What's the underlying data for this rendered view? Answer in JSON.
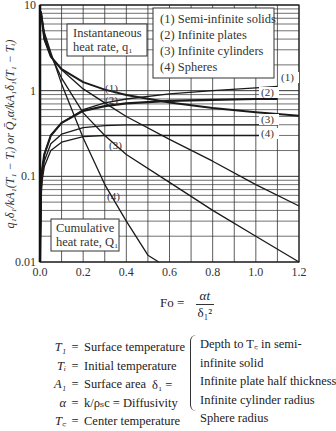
{
  "chart_data": {
    "type": "line",
    "title": "",
    "xlabel": "Fo = αt / δ₁²",
    "ylabel": "q₁δ₁/kA₁(T₁ − Tᵢ)  or  Q̄₁α/kA₁δ₁(T₁ − Tᵢ)",
    "xlim": [
      0.0,
      1.2
    ],
    "ylim": [
      0.01,
      10
    ],
    "yscale": "log",
    "grid": true,
    "x_ticks": [
      "0.0",
      "0.2",
      "0.4",
      "0.6",
      "0.8",
      "1.0",
      "1.2"
    ],
    "y_ticks": [
      "0.01",
      "0.1",
      "1",
      "10"
    ],
    "legend": {
      "placement": "top-right",
      "entries": [
        "(1) Semi-infinite solids",
        "(2) Infinite plates",
        "(3) Infinite cylinders",
        "(4) Spheres"
      ]
    },
    "annotations": {
      "instantaneous_box": [
        "Instantaneous",
        "heat rate, q₁"
      ],
      "cumulative_box": [
        "Cumulative",
        "heat rate, Q₁"
      ],
      "curve_labels": [
        "(1)",
        "(2)",
        "(3)",
        "(4)"
      ]
    },
    "series": [
      {
        "name": "(1) Semi-infinite solids — instantaneous",
        "group": "instantaneous",
        "x": [
          0.005,
          0.02,
          0.05,
          0.1,
          0.2,
          0.3,
          0.4,
          0.6,
          0.8,
          1.0,
          1.2
        ],
        "y": [
          8.0,
          4.0,
          2.5,
          1.78,
          1.26,
          1.03,
          0.89,
          0.73,
          0.63,
          0.56,
          0.51
        ]
      },
      {
        "name": "(2) Infinite plates — instantaneous",
        "group": "instantaneous",
        "x": [
          0.005,
          0.02,
          0.05,
          0.1,
          0.2,
          0.3,
          0.4,
          0.6,
          0.8,
          1.0,
          1.2
        ],
        "y": [
          8.0,
          4.0,
          2.5,
          1.75,
          1.05,
          0.72,
          0.5,
          0.27,
          0.15,
          0.08,
          0.045
        ]
      },
      {
        "name": "(3) Infinite cylinders — instantaneous",
        "group": "instantaneous",
        "x": [
          0.005,
          0.02,
          0.05,
          0.1,
          0.2,
          0.3,
          0.4,
          0.6,
          0.8,
          1.0,
          1.2
        ],
        "y": [
          8.0,
          4.5,
          2.6,
          1.4,
          0.55,
          0.3,
          0.18,
          0.085,
          0.04,
          0.02,
          0.0095
        ]
      },
      {
        "name": "(4) Spheres — instantaneous",
        "group": "instantaneous",
        "x": [
          0.005,
          0.02,
          0.05,
          0.1,
          0.2,
          0.3,
          0.4,
          0.5,
          0.55
        ],
        "y": [
          8.5,
          4.8,
          2.8,
          1.2,
          0.28,
          0.08,
          0.03,
          0.012,
          0.01
        ]
      },
      {
        "name": "(1) Semi-infinite solids — cumulative",
        "group": "cumulative",
        "x": [
          0.0,
          0.005,
          0.01,
          0.02,
          0.05,
          0.1,
          0.2,
          0.3,
          0.4,
          0.6,
          0.8,
          1.0,
          1.1
        ],
        "y": [
          0.01,
          0.08,
          0.12,
          0.18,
          0.3,
          0.42,
          0.6,
          0.72,
          0.8,
          0.92,
          1.0,
          1.08,
          1.12
        ]
      },
      {
        "name": "(2) Infinite plates — cumulative",
        "group": "cumulative",
        "x": [
          0.0,
          0.005,
          0.01,
          0.02,
          0.05,
          0.1,
          0.2,
          0.3,
          0.4,
          0.6,
          0.8,
          1.0,
          1.1
        ],
        "y": [
          0.01,
          0.08,
          0.12,
          0.18,
          0.3,
          0.42,
          0.58,
          0.66,
          0.71,
          0.76,
          0.78,
          0.8,
          0.8
        ]
      },
      {
        "name": "(3) Infinite cylinders — cumulative",
        "group": "cumulative",
        "x": [
          0.0,
          0.005,
          0.01,
          0.02,
          0.05,
          0.1,
          0.2,
          0.3,
          0.4,
          0.6,
          0.8,
          1.0,
          1.1
        ],
        "y": [
          0.01,
          0.07,
          0.1,
          0.15,
          0.24,
          0.31,
          0.37,
          0.39,
          0.4,
          0.4,
          0.4,
          0.4,
          0.4
        ]
      },
      {
        "name": "(4) Spheres — cumulative",
        "group": "cumulative",
        "x": [
          0.0,
          0.005,
          0.01,
          0.02,
          0.05,
          0.1,
          0.2,
          0.3,
          0.4,
          0.6,
          0.8,
          1.0,
          1.1
        ],
        "y": [
          0.01,
          0.06,
          0.09,
          0.13,
          0.2,
          0.25,
          0.29,
          0.3,
          0.3,
          0.3,
          0.3,
          0.3,
          0.3
        ]
      }
    ]
  },
  "formula": {
    "lhs": "Fo =",
    "numerator": "αt",
    "denominator": "δ₁²"
  },
  "definitions": [
    {
      "symbol": "T₁",
      "text": "Surface temperature"
    },
    {
      "symbol": "Tᵢ",
      "text": "Initial temperature"
    },
    {
      "symbol": "A₁",
      "text": "Surface area"
    },
    {
      "symbol": "α",
      "text": "k/ρₛc = Diffusivity"
    },
    {
      "symbol": "T꜀",
      "text": "Center temperature"
    }
  ],
  "delta_def": {
    "symbol": "δ₁ =",
    "items": [
      "Depth to T꜀ in semi-",
      "infinite solid",
      "Infinite plate half thickness",
      "Infinite cylinder radius",
      "Sphere radius"
    ]
  }
}
